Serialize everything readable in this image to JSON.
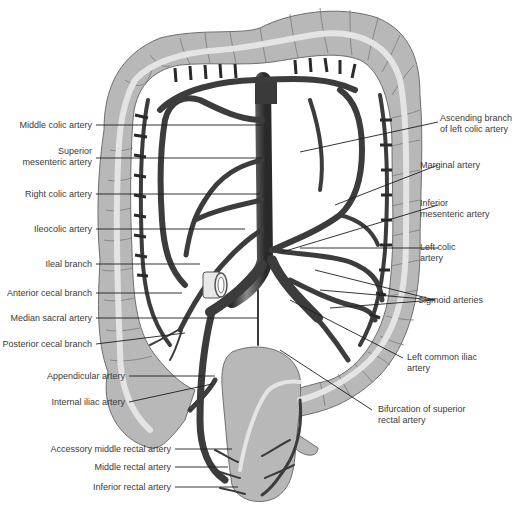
{
  "figure": {
    "colors": {
      "colon_fill": "#b8b8b8",
      "colon_outline": "#6e6e6e",
      "colon_lumen": "#e4e4e4",
      "vessel": "#3c3c3c",
      "vessel_dark": "#2a2a2a",
      "leader_line": "#1e1e1e",
      "label_text": "#3a3a3a",
      "background": "#ffffff"
    },
    "labels_left": [
      {
        "id": "middle-colic-artery",
        "text": "Middle colic artery"
      },
      {
        "id": "superior-mesenteric-artery-1",
        "text": "Superior"
      },
      {
        "id": "superior-mesenteric-artery-2",
        "text": "mesenteric artery"
      },
      {
        "id": "right-colic-artery",
        "text": "Right colic artery"
      },
      {
        "id": "ileocolic-artery",
        "text": "Ileocolic artery"
      },
      {
        "id": "ileal-branch",
        "text": "Ileal branch"
      },
      {
        "id": "anterior-cecal-branch",
        "text": "Anterior cecal branch"
      },
      {
        "id": "median-sacral-artery",
        "text": "Median sacral artery"
      },
      {
        "id": "posterior-cecal-branch",
        "text": "Posterior cecal branch"
      },
      {
        "id": "appendicular-artery",
        "text": "Appendicular artery"
      },
      {
        "id": "internal-iliac-artery",
        "text": "Internal iliac artery"
      },
      {
        "id": "accessory-middle-rectal-artery",
        "text": "Accessory middle rectal artery"
      },
      {
        "id": "middle-rectal-artery",
        "text": "Middle rectal artery"
      },
      {
        "id": "inferior-rectal-artery",
        "text": "Inferior rectal artery"
      }
    ],
    "labels_right": [
      {
        "id": "ascending-branch-1",
        "text": "Ascending branch"
      },
      {
        "id": "ascending-branch-2",
        "text": "of left colic artery"
      },
      {
        "id": "marginal-artery",
        "text": "Marginal artery"
      },
      {
        "id": "inferior-mesenteric-1",
        "text": "Inferior"
      },
      {
        "id": "inferior-mesenteric-2",
        "text": "mesenteric artery"
      },
      {
        "id": "left-colic-1",
        "text": "Left colic"
      },
      {
        "id": "left-colic-2",
        "text": "artery"
      },
      {
        "id": "sigmoid-arteries",
        "text": "Sigmoid arteries"
      },
      {
        "id": "left-common-iliac-1",
        "text": "Left common iliac"
      },
      {
        "id": "left-common-iliac-2",
        "text": "artery"
      },
      {
        "id": "bifurcation-1",
        "text": "Bifurcation of superior"
      },
      {
        "id": "bifurcation-2",
        "text": "rectal artery"
      }
    ]
  }
}
